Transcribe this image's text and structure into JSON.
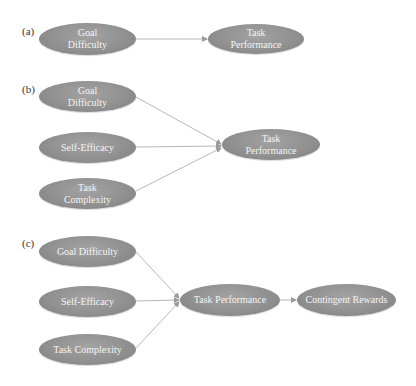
{
  "panels": [
    {
      "label": "(a)",
      "nodes": [
        {
          "id": "goal-difficulty",
          "text": "Goal\nDifficulty"
        },
        {
          "id": "task-performance",
          "text": "Task\nPerformance"
        }
      ],
      "edges": [
        [
          "goal-difficulty",
          "task-performance"
        ]
      ]
    },
    {
      "label": "(b)",
      "nodes": [
        {
          "id": "goal-difficulty",
          "text": "Goal\nDifficulty"
        },
        {
          "id": "self-efficacy",
          "text": "Self-Efficacy"
        },
        {
          "id": "task-complexity",
          "text": "Task\nComplexity"
        },
        {
          "id": "task-performance",
          "text": "Task\nPerformance"
        }
      ],
      "edges": [
        [
          "goal-difficulty",
          "task-performance"
        ],
        [
          "self-efficacy",
          "task-performance"
        ],
        [
          "task-complexity",
          "task-performance"
        ]
      ]
    },
    {
      "label": "(c)",
      "nodes": [
        {
          "id": "goal-difficulty",
          "text": "Goal Difficulty"
        },
        {
          "id": "self-efficacy",
          "text": "Self-Efficacy"
        },
        {
          "id": "task-complexity",
          "text": "Task Complexity"
        },
        {
          "id": "task-performance",
          "text": "Task Performance"
        },
        {
          "id": "contingent-rewards",
          "text": "Contingent Rewards"
        }
      ],
      "edges": [
        [
          "goal-difficulty",
          "task-performance"
        ],
        [
          "self-efficacy",
          "task-performance"
        ],
        [
          "task-complexity",
          "task-performance"
        ],
        [
          "task-performance",
          "contingent-rewards"
        ]
      ]
    }
  ],
  "colors": {
    "node_fill": "#8f8f8f",
    "node_text": "#f4f4f4",
    "edge": "#b8b8b8"
  }
}
